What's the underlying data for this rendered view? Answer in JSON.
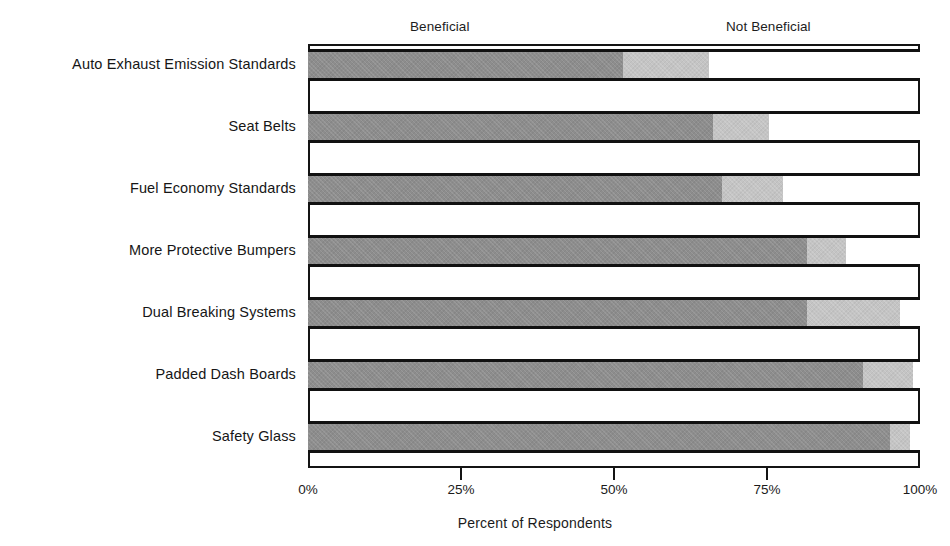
{
  "chart_data": {
    "type": "bar",
    "orientation": "horizontal",
    "stacked": true,
    "title": "",
    "subtitle": "",
    "xlabel": "Percent of Respondents",
    "ylabel": "",
    "xlim": [
      0,
      100
    ],
    "grid": false,
    "legend_position": "top",
    "headers": {
      "beneficial": "Beneficial",
      "not_beneficial": "Not Beneficial"
    },
    "axis": {
      "tick_labels": [
        "0%",
        "25%",
        "50%",
        "75%",
        "100%"
      ],
      "tick_values": [
        0,
        25,
        50,
        75,
        100
      ]
    },
    "series": [
      {
        "name": "Beneficial",
        "color": "#8d8d8d",
        "values": [
          51.4,
          66.1,
          67.7,
          81.5,
          81.5,
          90.7,
          95.1
        ]
      },
      {
        "name": "Intermediate",
        "color": "#c4c4c4",
        "values": [
          14.2,
          9.3,
          9.9,
          6.4,
          15.2,
          8.2,
          3.2
        ]
      },
      {
        "name": "Not Beneficial",
        "color": "#ffffff",
        "values": [
          34.4,
          24.6,
          22.4,
          12.1,
          3.3,
          1.1,
          1.7
        ]
      }
    ],
    "categories": [
      "Auto Exhaust Emission Standards",
      "Seat Belts",
      "Fuel Economy Standards",
      "More Protective Bumpers",
      "Dual Breaking Systems",
      "Padded Dash Boards",
      "Safety Glass"
    ],
    "rows": [
      {
        "label": "Auto Exhaust Emission Standards",
        "dark_end": 51.4,
        "light_end": 65.6
      },
      {
        "label": "Seat Belts",
        "dark_end": 66.1,
        "light_end": 75.4
      },
      {
        "label": "Fuel Economy Standards",
        "dark_end": 67.7,
        "light_end": 77.6
      },
      {
        "label": "More Protective Bumpers",
        "dark_end": 81.5,
        "light_end": 87.9
      },
      {
        "label": "Dual Breaking Systems",
        "dark_end": 81.5,
        "light_end": 96.7
      },
      {
        "label": "Padded Dash Boards",
        "dark_end": 90.7,
        "light_end": 98.9
      },
      {
        "label": "Safety Glass",
        "dark_end": 95.1,
        "light_end": 98.3
      }
    ]
  }
}
